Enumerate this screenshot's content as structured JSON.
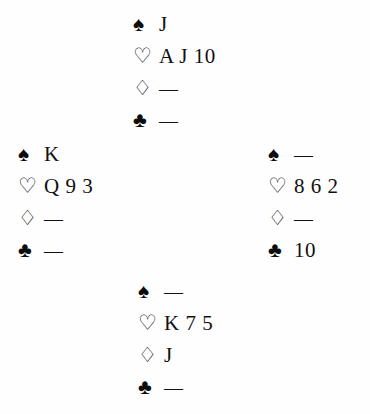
{
  "diagram": {
    "type": "bridge-deal-diagram",
    "suit_symbols": {
      "spades": "♠",
      "hearts": "♡",
      "diamonds": "♢",
      "clubs": "♣"
    },
    "void_marker": "—",
    "hands": {
      "north": {
        "position": "north",
        "suits": [
          {
            "suit": "spades",
            "icon": "spade-icon",
            "ranks": "J"
          },
          {
            "suit": "hearts",
            "icon": "heart-icon",
            "ranks": "A J 10"
          },
          {
            "suit": "diamonds",
            "icon": "diamond-icon",
            "ranks": "—"
          },
          {
            "suit": "clubs",
            "icon": "club-icon",
            "ranks": "—"
          }
        ]
      },
      "west": {
        "position": "west",
        "suits": [
          {
            "suit": "spades",
            "icon": "spade-icon",
            "ranks": "K"
          },
          {
            "suit": "hearts",
            "icon": "heart-icon",
            "ranks": "Q 9 3"
          },
          {
            "suit": "diamonds",
            "icon": "diamond-icon",
            "ranks": "—"
          },
          {
            "suit": "clubs",
            "icon": "club-icon",
            "ranks": "—"
          }
        ]
      },
      "east": {
        "position": "east",
        "suits": [
          {
            "suit": "spades",
            "icon": "spade-icon",
            "ranks": "—"
          },
          {
            "suit": "hearts",
            "icon": "heart-icon",
            "ranks": "8 6 2"
          },
          {
            "suit": "diamonds",
            "icon": "diamond-icon",
            "ranks": "—"
          },
          {
            "suit": "clubs",
            "icon": "club-icon",
            "ranks": "10"
          }
        ]
      },
      "south": {
        "position": "south",
        "suits": [
          {
            "suit": "spades",
            "icon": "spade-icon",
            "ranks": "—"
          },
          {
            "suit": "hearts",
            "icon": "heart-icon",
            "ranks": "K 7 5"
          },
          {
            "suit": "diamonds",
            "icon": "diamond-icon",
            "ranks": "J"
          },
          {
            "suit": "clubs",
            "icon": "club-icon",
            "ranks": "—"
          }
        ]
      }
    }
  }
}
